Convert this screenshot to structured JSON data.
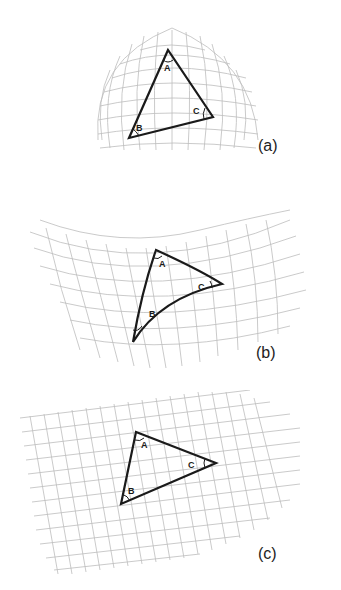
{
  "figure": {
    "panels": [
      {
        "id": "a",
        "label": "(a)",
        "surface": "sphere (positive curvature)",
        "vertices": {
          "A": "A",
          "B": "B",
          "C": "C"
        }
      },
      {
        "id": "b",
        "label": "(b)",
        "surface": "saddle (negative curvature)",
        "vertices": {
          "A": "A",
          "B": "B",
          "C": "C"
        }
      },
      {
        "id": "c",
        "label": "(c)",
        "surface": "plane (zero curvature)",
        "vertices": {
          "A": "A",
          "B": "B",
          "C": "C"
        }
      }
    ],
    "colors": {
      "grid": "#bdbdbd",
      "triangle": "#1a1a1a",
      "background": "#ffffff"
    }
  }
}
